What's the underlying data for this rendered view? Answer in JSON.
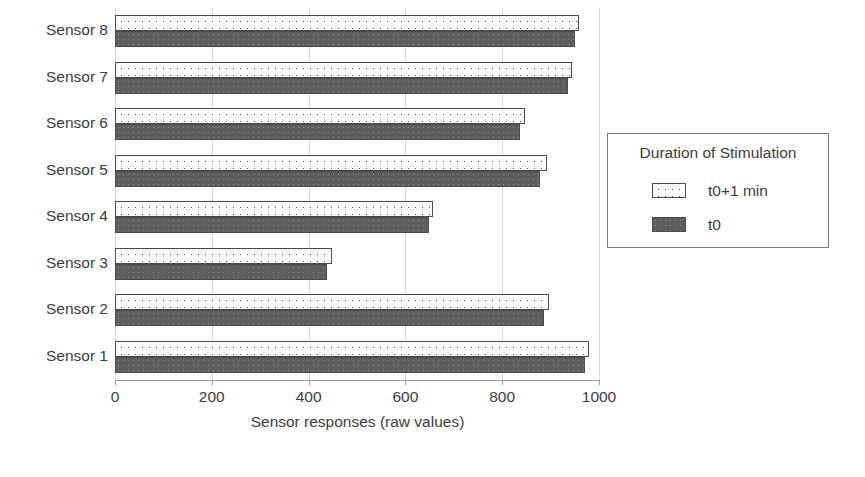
{
  "chart_data": {
    "type": "bar",
    "orientation": "horizontal",
    "title": "",
    "xlabel": "Sensor responses (raw values)",
    "ylabel": "",
    "xlim": [
      0,
      1000
    ],
    "xticks": [
      0,
      200,
      400,
      600,
      800,
      1000
    ],
    "xtick_labels": [
      "0",
      "200",
      "400",
      "600",
      "800",
      "1000"
    ],
    "grid": true,
    "grid_axis": "x",
    "legend_title": "Duration of Stimulation",
    "legend_position": "right-outside",
    "categories": [
      "Sensor 1",
      "Sensor 2",
      "Sensor 3",
      "Sensor 4",
      "Sensor 5",
      "Sensor 6",
      "Sensor 7",
      "Sensor 8"
    ],
    "series": [
      {
        "name": "t0+1 min",
        "pattern": "dotted",
        "color": "#fbfbfb",
        "values": [
          980,
          896,
          448,
          656,
          892,
          848,
          945,
          958
        ]
      },
      {
        "name": "t0",
        "pattern": "solid-gray",
        "color": "#5e5e5e",
        "values": [
          972,
          886,
          437,
          648,
          878,
          836,
          935,
          950
        ]
      }
    ]
  },
  "legend": {
    "title": "Duration of Stimulation",
    "entries": [
      {
        "label": "t0+1 min",
        "swatch": "dotted-swatch"
      },
      {
        "label": "t0",
        "swatch": "gray-swatch"
      }
    ]
  },
  "axis": {
    "x_title": "Sensor responses (raw values)",
    "x_tick_labels": [
      "0",
      "200",
      "400",
      "600",
      "800",
      "1000"
    ],
    "y_tick_labels": [
      "Sensor 8",
      "Sensor 7",
      "Sensor 6",
      "Sensor 5",
      "Sensor 4",
      "Sensor 3",
      "Sensor 2",
      "Sensor 1"
    ]
  },
  "colors": {
    "series_dotted_fill": "#fbfbfb",
    "series_solid_fill": "#5e5e5e",
    "bar_border": "#4a4a4a",
    "gridline": "#d8d8d8",
    "axis": "#9a9a9a",
    "text": "#3c3c3c",
    "background": "#ffffff"
  }
}
